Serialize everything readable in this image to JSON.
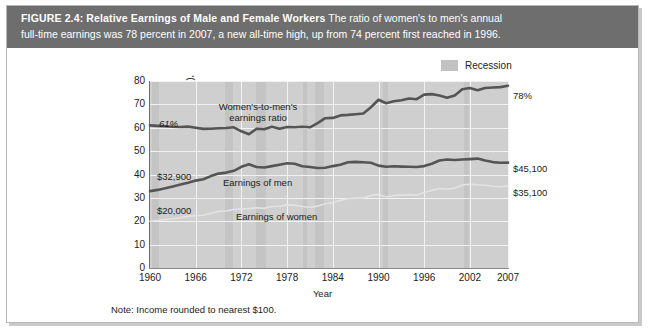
{
  "figure": {
    "label": "FIGURE 2.4:",
    "title": "Relative Earnings of Male and Female Workers",
    "subtitle_line1": "The ratio of women's to men's annual",
    "subtitle_line2": "full-time earnings was 78 percent in 2007, a new all-time high, up from 74 percent first reached in 1996.",
    "note": "Note: Income rounded to nearest $100."
  },
  "legend": {
    "items": [
      {
        "label": "Recession",
        "color": "#c2c2c2"
      }
    ]
  },
  "annotations": {
    "ratio_label_line1": "Women's-to-men's",
    "ratio_label_line2": "earnings ratio",
    "men_label": "Earnings of men",
    "women_label": "Earnings of women",
    "start_ratio": "61%",
    "start_men": "$32,900",
    "start_women": "$20,000",
    "end_ratio": "78%",
    "end_men": "$45,100",
    "end_women": "$35,100"
  },
  "chart_data": {
    "type": "line",
    "title": "Relative Earnings of Male and Female Workers",
    "xlabel": "Year",
    "ylabel": "Earnings in thousands (2007 dollars), ratio in percent",
    "ylabel_line1": "Earnings in thousands (2007 dollars),",
    "ylabel_line2": "ratio in percent",
    "xlim": [
      1960,
      2007
    ],
    "ylim": [
      0,
      80
    ],
    "yticks": [
      0,
      10,
      20,
      30,
      40,
      50,
      60,
      70,
      80
    ],
    "xticks": [
      1960,
      1966,
      1972,
      1978,
      1984,
      1990,
      1996,
      2002,
      2007
    ],
    "grid": true,
    "legend_position": "top-right",
    "x": [
      1960,
      1961,
      1962,
      1963,
      1964,
      1965,
      1966,
      1967,
      1968,
      1969,
      1970,
      1971,
      1972,
      1973,
      1974,
      1975,
      1976,
      1977,
      1978,
      1979,
      1980,
      1981,
      1982,
      1983,
      1984,
      1985,
      1986,
      1987,
      1988,
      1989,
      1990,
      1991,
      1992,
      1993,
      1994,
      1995,
      1996,
      1997,
      1998,
      1999,
      2000,
      2001,
      2002,
      2003,
      2004,
      2005,
      2006,
      2007
    ],
    "series": [
      {
        "name": "Women's-to-men's earnings ratio",
        "color": "#555555",
        "units": "percent",
        "values": [
          61.0,
          60.8,
          60.6,
          60.4,
          60.3,
          60.5,
          60.0,
          59.5,
          59.6,
          59.8,
          59.9,
          60.2,
          58.5,
          57.2,
          59.6,
          59.4,
          60.4,
          59.6,
          60.3,
          60.2,
          60.4,
          60.2,
          62.0,
          64.1,
          64.2,
          65.3,
          65.5,
          65.8,
          66.1,
          68.8,
          72.0,
          70.5,
          71.3,
          71.8,
          72.5,
          72.2,
          74.2,
          74.4,
          73.8,
          72.8,
          73.8,
          76.5,
          77.0,
          76.0,
          77.0,
          77.2,
          77.4,
          78.0
        ]
      },
      {
        "name": "Earnings of men",
        "color": "#555555",
        "units": "thousands of 2007 dollars",
        "values": [
          32.9,
          33.4,
          34.1,
          34.9,
          35.7,
          36.5,
          37.4,
          38.0,
          39.3,
          40.4,
          40.8,
          41.6,
          43.3,
          44.4,
          43.2,
          43.0,
          43.6,
          44.2,
          44.8,
          44.6,
          43.5,
          43.2,
          42.8,
          42.9,
          43.6,
          44.2,
          45.2,
          45.4,
          45.2,
          45.0,
          43.8,
          43.3,
          43.5,
          43.4,
          43.3,
          43.2,
          43.6,
          44.6,
          46.0,
          46.4,
          46.2,
          46.4,
          46.6,
          46.8,
          46.0,
          45.3,
          45.0,
          45.1
        ]
      },
      {
        "name": "Earnings of women",
        "color": "#e3e3e3",
        "units": "thousands of 2007 dollars",
        "values": [
          20.0,
          20.3,
          20.7,
          21.1,
          21.5,
          22.1,
          22.4,
          22.6,
          23.4,
          24.2,
          24.4,
          25.0,
          25.3,
          25.4,
          25.8,
          25.5,
          26.3,
          26.4,
          27.0,
          26.9,
          26.3,
          26.0,
          26.5,
          27.5,
          28.0,
          28.9,
          29.6,
          29.9,
          29.9,
          31.0,
          31.5,
          30.5,
          31.0,
          31.2,
          31.4,
          31.2,
          32.3,
          33.2,
          34.0,
          33.8,
          34.1,
          35.5,
          35.9,
          35.6,
          35.4,
          35.0,
          34.8,
          35.1
        ]
      }
    ],
    "recessions": [
      {
        "start": 1960.3,
        "end": 1961.2
      },
      {
        "start": 1969.9,
        "end": 1970.9
      },
      {
        "start": 1973.9,
        "end": 1975.2
      },
      {
        "start": 1980.1,
        "end": 1980.6
      },
      {
        "start": 1981.6,
        "end": 1982.9
      },
      {
        "start": 1990.6,
        "end": 1991.2
      },
      {
        "start": 2001.2,
        "end": 2001.9
      }
    ]
  }
}
